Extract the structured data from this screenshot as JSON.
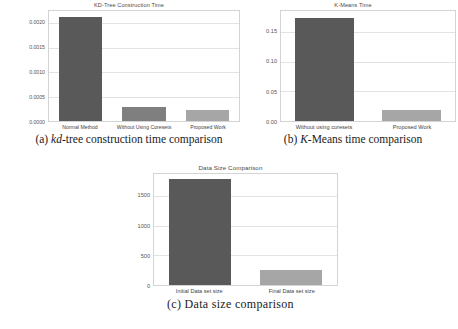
{
  "figure": {
    "panels": [
      {
        "id": "a",
        "caption_prefix": "(a)",
        "caption_italic": "kd",
        "caption_rest": "-tree construction time comparison"
      },
      {
        "id": "b",
        "caption_prefix": "(b)",
        "caption_italic": "K",
        "caption_rest": "-Means time comparison"
      },
      {
        "id": "c",
        "caption_prefix": "(c)",
        "caption_italic": "",
        "caption_rest": "Data size comparison"
      }
    ]
  },
  "chart_data": [
    {
      "type": "bar",
      "title": "KD-Tree Construction Time",
      "xlabel": "",
      "ylabel": "",
      "categories": [
        "Normal Method",
        "Without Using Coresets",
        "Proposed Work"
      ],
      "values": [
        0.00213,
        0.00029,
        0.00022
      ],
      "colors": [
        "#595959",
        "#7f7f7f",
        "#a6a6a6"
      ],
      "yticks": [
        "0.0000",
        "0.0005",
        "0.0010",
        "0.0015",
        "0.0020"
      ],
      "ytick_values": [
        0.0,
        0.0005,
        0.001,
        0.0015,
        0.002
      ],
      "ylim": [
        0,
        0.00225
      ],
      "grid": true,
      "legend": "none"
    },
    {
      "type": "bar",
      "title": "K-Means Time",
      "xlabel": "",
      "ylabel": "",
      "categories": [
        "Without using coresets",
        "Proposed Work"
      ],
      "values": [
        0.173,
        0.018
      ],
      "colors": [
        "#595959",
        "#a6a6a6"
      ],
      "yticks": [
        "0.00",
        "0.05",
        "0.10",
        "0.15"
      ],
      "ytick_values": [
        0.0,
        0.05,
        0.1,
        0.15
      ],
      "ylim": [
        0,
        0.185
      ],
      "grid": true,
      "legend": "none"
    },
    {
      "type": "bar",
      "title": "Data Size Comparison",
      "xlabel": "",
      "ylabel": "",
      "categories": [
        "Initial Data set size",
        "Final Data set size"
      ],
      "values": [
        1790,
        250
      ],
      "colors": [
        "#595959",
        "#a6a6a6"
      ],
      "yticks": [
        "0",
        "500",
        "1000",
        "1500"
      ],
      "ytick_values": [
        0,
        500,
        1000,
        1500
      ],
      "ylim": [
        0,
        1870
      ],
      "grid": true,
      "legend": "none"
    }
  ]
}
